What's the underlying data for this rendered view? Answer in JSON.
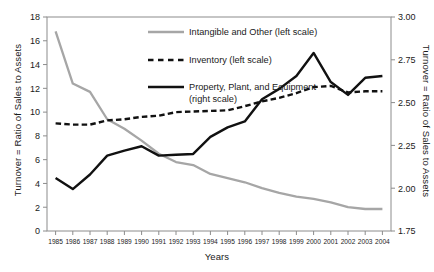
{
  "chart_data": {
    "type": "line",
    "title": "",
    "xlabel": "Years",
    "ylabel": "Turnover = Ratio of Sales to Assets",
    "ylabel_right": "Turnover = Ratio of Sales to Assets",
    "x": [
      1985,
      1986,
      1987,
      1988,
      1989,
      1990,
      1991,
      1992,
      1993,
      1994,
      1995,
      1996,
      1997,
      1998,
      1999,
      2000,
      2001,
      2002,
      2003,
      2004
    ],
    "xtick_labels": [
      "1985",
      "1986",
      "1987",
      "1988",
      "1989",
      "1990",
      "1991",
      "1992",
      "1993",
      "1994",
      "1995",
      "1996",
      "1997",
      "1998",
      "1999",
      "2000",
      "2001",
      "2002",
      "2003",
      "2004"
    ],
    "ylim": [
      0,
      18
    ],
    "ytick_labels": [
      "0",
      "2",
      "4",
      "6",
      "8",
      "10",
      "12",
      "14",
      "16",
      "18"
    ],
    "ytick_values": [
      0,
      2,
      4,
      6,
      8,
      10,
      12,
      14,
      16,
      18
    ],
    "ylim_right": [
      1.75,
      3.0
    ],
    "ytick_labels_right": [
      "1.75",
      "2.00",
      "2.25",
      "2.50",
      "2.75",
      "3.00"
    ],
    "ytick_values_right": [
      1.75,
      2.0,
      2.25,
      2.5,
      2.75,
      3.0
    ],
    "grid": false,
    "legend_position": "upper-center",
    "series": [
      {
        "name": "Intangible and Other (left scale)",
        "axis": "left",
        "color": "#a6a6a6",
        "style": "solid",
        "width": 2.3,
        "values": [
          16.8,
          12.4,
          11.7,
          9.4,
          8.6,
          7.6,
          6.5,
          5.8,
          5.55,
          4.8,
          4.45,
          4.1,
          3.6,
          3.2,
          2.9,
          2.7,
          2.4,
          2.0,
          1.85,
          1.85
        ]
      },
      {
        "name": "Inventory (left scale)",
        "axis": "left",
        "color": "#111111",
        "style": "dashed",
        "width": 2.4,
        "values": [
          9.05,
          8.95,
          8.95,
          9.3,
          9.4,
          9.6,
          9.7,
          10.0,
          10.05,
          10.1,
          10.15,
          10.5,
          10.9,
          11.2,
          11.6,
          12.1,
          12.2,
          11.65,
          11.75,
          11.75
        ]
      },
      {
        "name": "Property, Plant, and Equipment (right scale)",
        "axis": "right",
        "color": "#111111",
        "style": "solid",
        "width": 2.4,
        "values": [
          2.06,
          1.995,
          2.08,
          2.19,
          2.22,
          2.245,
          2.19,
          2.195,
          2.2,
          2.3,
          2.355,
          2.39,
          2.52,
          2.58,
          2.655,
          2.79,
          2.62,
          2.545,
          2.645,
          2.655
        ]
      }
    ],
    "legend_entries": [
      {
        "label": "Intangible and Other (left scale)",
        "color": "#a6a6a6",
        "style": "solid"
      },
      {
        "label": "Inventory (left scale)",
        "color": "#111111",
        "style": "dashed"
      },
      {
        "label": "Property, Plant, and Equipment",
        "label2": "(right scale)",
        "color": "#111111",
        "style": "solid"
      }
    ]
  }
}
